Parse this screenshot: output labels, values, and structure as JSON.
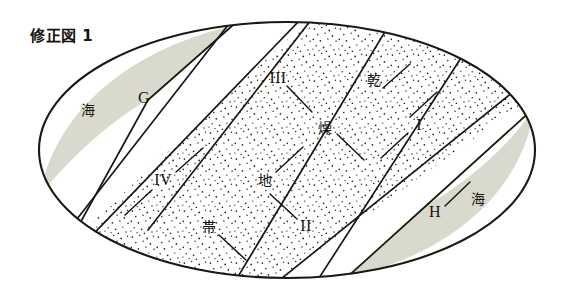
{
  "figure": {
    "title": "修正図 1",
    "kind": "schematic-ellipse-diagram",
    "colors": {
      "outline": "#1a1812",
      "sea_fill": "#d9d9cd",
      "land_fill": "#ffffff",
      "stipple_dot": "#2b2820",
      "page_background": "#ffffff",
      "text": "#17150f"
    },
    "ellipse": {
      "center_x": 287,
      "center_y": 150,
      "radius_x": 248,
      "radius_y": 128
    },
    "regions": [
      {
        "id": "sea-upper-left",
        "label": "海",
        "fill": "sea"
      },
      {
        "id": "sea-lower-right",
        "label": "海",
        "fill": "sea"
      },
      {
        "id": "arid-belt",
        "label": "乾燥地帯",
        "fill": "stipple"
      }
    ],
    "labels": [
      {
        "id": "sea-left",
        "name": "sea-label-left",
        "text": "海",
        "x": 88,
        "y": 110,
        "style": "kanji"
      },
      {
        "id": "point-g",
        "name": "point-label-g",
        "text": "G",
        "x": 144,
        "y": 98,
        "style": "roman"
      },
      {
        "id": "band-iii",
        "name": "band-label-iii",
        "text": "III",
        "x": 278,
        "y": 78,
        "style": "roman"
      },
      {
        "id": "kanji-kan",
        "name": "arid-label-kan",
        "text": "乾",
        "x": 374,
        "y": 80,
        "style": "kanji"
      },
      {
        "id": "kanji-so",
        "name": "arid-label-so",
        "text": "燥",
        "x": 325,
        "y": 128,
        "style": "kanji"
      },
      {
        "id": "band-i",
        "name": "band-label-i",
        "text": "I",
        "x": 419,
        "y": 125,
        "style": "roman"
      },
      {
        "id": "band-iv",
        "name": "band-label-iv",
        "text": "IV",
        "x": 163,
        "y": 180,
        "style": "roman"
      },
      {
        "id": "kanji-chi",
        "name": "arid-label-chi",
        "text": "地",
        "x": 265,
        "y": 180,
        "style": "kanji"
      },
      {
        "id": "kanji-tai",
        "name": "arid-label-tai",
        "text": "帯",
        "x": 209,
        "y": 227,
        "style": "kanji"
      },
      {
        "id": "band-ii",
        "name": "band-label-ii",
        "text": "II",
        "x": 306,
        "y": 226,
        "style": "roman"
      },
      {
        "id": "point-h",
        "name": "point-label-h",
        "text": "H",
        "x": 435,
        "y": 212,
        "style": "roman"
      },
      {
        "id": "sea-right",
        "name": "sea-label-right",
        "text": "海",
        "x": 478,
        "y": 199,
        "style": "kanji"
      }
    ]
  }
}
